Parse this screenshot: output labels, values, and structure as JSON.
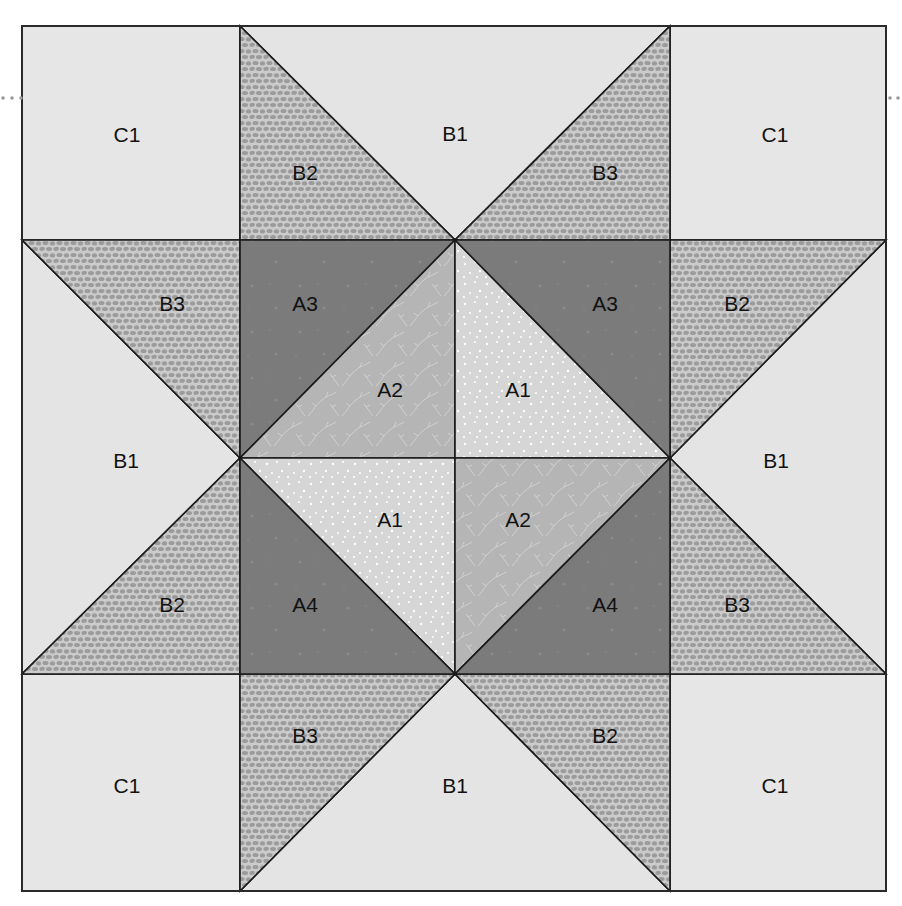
{
  "colors": {
    "C1": "#e6e6e6",
    "B1": "#e4e4e4",
    "B_pebble_bg": "#cbcbcb",
    "B_pebble_fg": "#9b9b9b",
    "A1": "#d6d6d6",
    "A1_dots": "#ffffff",
    "A2": "#b5b5b5",
    "A2_vine": "#d2d2d2",
    "A_dark": "#7b7b7b",
    "seam": "#1a1a1a"
  },
  "grid": {
    "columns": [
      22,
      240,
      455,
      670,
      886
    ],
    "rows": [
      26,
      240,
      458,
      674,
      891
    ]
  },
  "pieces": [
    {
      "id": "c1-tl",
      "label": "C1",
      "fabric": "C1",
      "points": "22,26 240,26 240,240 22,240",
      "lx": 127,
      "ly": 134
    },
    {
      "id": "c1-tr",
      "label": "C1",
      "fabric": "C1",
      "points": "670,26 886,26 886,240 670,240",
      "lx": 775,
      "ly": 134
    },
    {
      "id": "c1-bl",
      "label": "C1",
      "fabric": "C1",
      "points": "22,674 240,674 240,891 22,891",
      "lx": 127,
      "ly": 785
    },
    {
      "id": "c1-br",
      "label": "C1",
      "fabric": "C1",
      "points": "670,674 886,674 886,891 670,891",
      "lx": 775,
      "ly": 785
    },
    {
      "id": "b1-top",
      "label": "B1",
      "fabric": "B1",
      "points": "240,26 670,26 455,240",
      "lx": 455,
      "ly": 133
    },
    {
      "id": "b2-top",
      "label": "B2",
      "fabric": "Bpebble",
      "points": "240,26 455,240 240,240",
      "lx": 305,
      "ly": 172
    },
    {
      "id": "b3-top",
      "label": "B3",
      "fabric": "Bpebble",
      "points": "670,26 670,240 455,240",
      "lx": 605,
      "ly": 172
    },
    {
      "id": "b1-left",
      "label": "B1",
      "fabric": "B1",
      "points": "22,240 240,458 22,674",
      "lx": 126,
      "ly": 460
    },
    {
      "id": "b3-left",
      "label": "B3",
      "fabric": "Bpebble",
      "points": "22,240 240,240 240,458",
      "lx": 172,
      "ly": 303
    },
    {
      "id": "b2-left",
      "label": "B2",
      "fabric": "Bpebble",
      "points": "240,458 240,674 22,674",
      "lx": 172,
      "ly": 604
    },
    {
      "id": "b1-right",
      "label": "B1",
      "fabric": "B1",
      "points": "886,240 886,674 670,458",
      "lx": 776,
      "ly": 460
    },
    {
      "id": "b2-right",
      "label": "B2",
      "fabric": "Bpebble",
      "points": "670,240 886,240 670,458",
      "lx": 737,
      "ly": 303
    },
    {
      "id": "b3-right",
      "label": "B3",
      "fabric": "Bpebble",
      "points": "670,458 886,674 670,674",
      "lx": 737,
      "ly": 604
    },
    {
      "id": "b1-bottom",
      "label": "B1",
      "fabric": "B1",
      "points": "455,674 670,891 240,891",
      "lx": 455,
      "ly": 785
    },
    {
      "id": "b3-bottom",
      "label": "B3",
      "fabric": "Bpebble",
      "points": "240,674 455,674 240,891",
      "lx": 305,
      "ly": 735
    },
    {
      "id": "b2-bottom",
      "label": "B2",
      "fabric": "Bpebble",
      "points": "455,674 670,674 670,891",
      "lx": 605,
      "ly": 735
    },
    {
      "id": "a3-tl",
      "label": "A3",
      "fabric": "Adark",
      "points": "240,240 455,240 240,458",
      "lx": 305,
      "ly": 303
    },
    {
      "id": "a2-tl",
      "label": "A2",
      "fabric": "A2",
      "points": "455,240 455,458 240,458",
      "lx": 390,
      "ly": 389
    },
    {
      "id": "a1-tr",
      "label": "A1",
      "fabric": "A1",
      "points": "455,240 670,458 455,458",
      "lx": 518,
      "ly": 389
    },
    {
      "id": "a3-tr",
      "label": "A3",
      "fabric": "Adark",
      "points": "455,240 670,240 670,458",
      "lx": 605,
      "ly": 303
    },
    {
      "id": "a1-bl",
      "label": "A1",
      "fabric": "A1",
      "points": "240,458 455,458 455,674",
      "lx": 390,
      "ly": 519
    },
    {
      "id": "a4-bl",
      "label": "A4",
      "fabric": "Adark",
      "points": "240,458 455,674 240,674",
      "lx": 305,
      "ly": 604
    },
    {
      "id": "a2-br",
      "label": "A2",
      "fabric": "A2",
      "points": "455,458 670,458 455,674",
      "lx": 518,
      "ly": 519
    },
    {
      "id": "a4-br",
      "label": "A4",
      "fabric": "Adark",
      "points": "670,458 670,674 455,674",
      "lx": 605,
      "ly": 604
    }
  ],
  "margin_dots": {
    "left": [
      [
        3,
        98
      ],
      [
        12,
        98
      ],
      [
        21,
        98
      ]
    ],
    "right": [
      [
        890,
        98
      ],
      [
        898,
        98
      ]
    ]
  }
}
